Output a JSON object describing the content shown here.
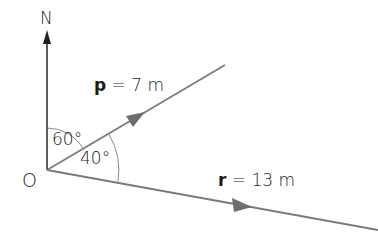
{
  "diagram": {
    "north_label": "N",
    "origin_label": "O",
    "angle_north_to_p": "60°",
    "angle_p_to_r": "40°",
    "vector_p": {
      "symbol": "p",
      "equals": " = 7 m",
      "magnitude": 7,
      "unit": "m",
      "bearing_deg": 60
    },
    "vector_r": {
      "symbol": "r",
      "equals": " = 13 m",
      "magnitude": 13,
      "unit": "m",
      "bearing_deg": 100
    },
    "colors": {
      "line": "#7a7a7a",
      "north_arrow": "#333333",
      "arc": "#8a8a8a",
      "text": "#1a1a1a"
    }
  }
}
